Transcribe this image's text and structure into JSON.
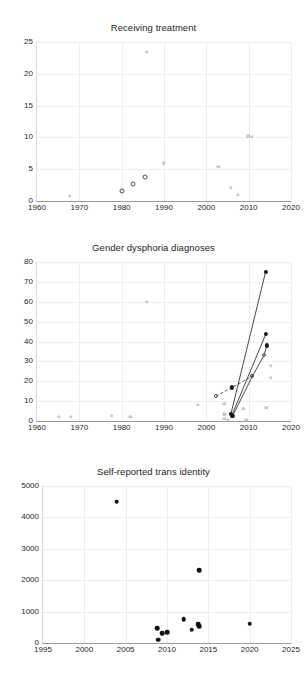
{
  "figure": {
    "background": "#ffffff",
    "marker_colors": {
      "gray": "#c6c8ca",
      "black": "#1a1a1a",
      "open_outline": "#4d4d4d",
      "gridline": "#eceef0",
      "axis": "#9a9a9a"
    }
  },
  "chart_data": [
    {
      "type": "scatter",
      "title": "Receiving treatment",
      "xlabel": "",
      "ylabel": "",
      "xlim": [
        1960,
        2020
      ],
      "ylim": [
        0,
        25
      ],
      "xticks": [
        1960,
        1970,
        1980,
        1990,
        2000,
        2010,
        2020
      ],
      "yticks": [
        0,
        5,
        10,
        15,
        20,
        25
      ],
      "grid": true,
      "legend": "none",
      "series": [
        {
          "name": "open-circle studies",
          "marker": "open-circle",
          "color": "#4d4d4d",
          "points": [
            {
              "x": 1980.0,
              "y": 1.5
            },
            {
              "x": 1982.6,
              "y": 2.6
            },
            {
              "x": 1985.6,
              "y": 3.8
            }
          ]
        },
        {
          "name": "gray studies",
          "marker": "filled-circle",
          "color": "#c6c8ca",
          "points": [
            {
              "x": 1967.7,
              "y": 0.8
            },
            {
              "x": 1986.0,
              "y": 23.5
            },
            {
              "x": 1990.0,
              "y": 5.9
            },
            {
              "x": 2002.8,
              "y": 5.4
            },
            {
              "x": 2005.8,
              "y": 2.1
            },
            {
              "x": 2007.4,
              "y": 1.0
            },
            {
              "x": 2009.9,
              "y": 10.2
            },
            {
              "x": 2010.8,
              "y": 10.1
            }
          ]
        }
      ]
    },
    {
      "type": "scatter",
      "title": "Gender dysphoria diagnoses",
      "xlabel": "",
      "ylabel": "",
      "xlim": [
        1960,
        2020
      ],
      "ylim": [
        0,
        80
      ],
      "xticks": [
        1960,
        1970,
        1980,
        1990,
        2000,
        2010,
        2020
      ],
      "yticks": [
        0,
        10,
        20,
        30,
        40,
        50,
        60,
        70,
        80
      ],
      "grid": true,
      "legend": "none",
      "series": [
        {
          "name": "gray studies",
          "marker": "filled-circle",
          "color": "#c6c8ca",
          "points": [
            {
              "x": 1965.1,
              "y": 2.0
            },
            {
              "x": 1968.0,
              "y": 2.0
            },
            {
              "x": 1977.7,
              "y": 2.5
            },
            {
              "x": 1982.0,
              "y": 2.0
            },
            {
              "x": 1986.0,
              "y": 60.0
            },
            {
              "x": 1998.0,
              "y": 8.0
            },
            {
              "x": 2004.2,
              "y": 8.5
            },
            {
              "x": 2004.2,
              "y": 3.3
            },
            {
              "x": 2004.2,
              "y": 1.0
            },
            {
              "x": 2005.0,
              "y": 0.6
            },
            {
              "x": 2008.7,
              "y": 6.0
            },
            {
              "x": 2009.4,
              "y": 0.7
            },
            {
              "x": 2014.2,
              "y": 6.7
            },
            {
              "x": 2015.3,
              "y": 27.8
            },
            {
              "x": 2015.3,
              "y": 21.8
            }
          ]
        },
        {
          "name": "cohort A (dashed)",
          "marker": "mixed",
          "color": "#333333",
          "line_style": "dashed",
          "points": [
            {
              "x": 2002.3,
              "y": 12.5,
              "marker": "open-circle"
            },
            {
              "x": 2006.1,
              "y": 16.9,
              "marker": "filled-circle"
            },
            {
              "x": 2010.9,
              "y": 22.6,
              "marker": "open-circle"
            }
          ]
        },
        {
          "name": "cohort B (solid long)",
          "marker": "filled-circle",
          "color": "#1a1a1a",
          "line_style": "solid",
          "points": [
            {
              "x": 2005.8,
              "y": 3.5
            },
            {
              "x": 2014.0,
              "y": 75.0
            }
          ]
        },
        {
          "name": "cohort C (solid)",
          "marker": "filled-circle",
          "color": "#1a1a1a",
          "line_style": "solid",
          "points": [
            {
              "x": 2006.0,
              "y": 2.7
            },
            {
              "x": 2014.1,
              "y": 44.0
            }
          ]
        },
        {
          "name": "cohort D (solid)",
          "marker": "mixed",
          "color": "#1a1a1a",
          "line_style": "solid",
          "points": [
            {
              "x": 2006.2,
              "y": 2.6,
              "marker": "filled-circle"
            },
            {
              "x": 2010.9,
              "y": 22.6,
              "marker": "open-circle"
            },
            {
              "x": 2013.6,
              "y": 33.0,
              "marker": "open-circle"
            },
            {
              "x": 2014.3,
              "y": 38.0,
              "marker": "filled-circle"
            }
          ]
        }
      ]
    },
    {
      "type": "scatter",
      "title": "Self-reported trans identity",
      "xlabel": "",
      "ylabel": "",
      "xlim": [
        1995,
        2025
      ],
      "ylim": [
        0,
        5000
      ],
      "xticks": [
        1995,
        2000,
        2005,
        2010,
        2015,
        2020,
        2025
      ],
      "yticks": [
        0,
        1000,
        2000,
        3000,
        4000,
        5000
      ],
      "grid": true,
      "legend": "none",
      "series": [
        {
          "name": "survey studies",
          "marker": "filled-circle",
          "color": "#111111",
          "points": [
            {
              "x": 2003.9,
              "y": 4500
            },
            {
              "x": 2008.8,
              "y": 470
            },
            {
              "x": 2008.9,
              "y": 110
            },
            {
              "x": 2009.4,
              "y": 310
            },
            {
              "x": 2010.0,
              "y": 350
            },
            {
              "x": 2012.0,
              "y": 750
            },
            {
              "x": 2013.0,
              "y": 420
            },
            {
              "x": 2013.8,
              "y": 600
            },
            {
              "x": 2013.9,
              "y": 540
            },
            {
              "x": 2013.9,
              "y": 2320
            },
            {
              "x": 2020.0,
              "y": 620
            }
          ]
        }
      ]
    }
  ]
}
